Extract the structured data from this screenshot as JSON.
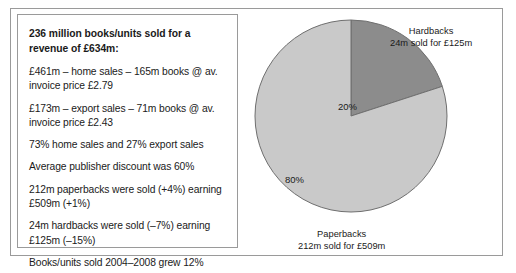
{
  "figure": {
    "panel_headline": "236 million books/units sold for a revenue of £634m:",
    "stat_lines": [
      "£461m – home sales – 165m books @ av. invoice price £2.79",
      "£173m – export sales – 71m books @ av. invoice price £2.43",
      "73% home sales and 27% export sales",
      "Average publisher discount was 60%",
      "212m paperbacks were sold (+4%) earning £509m (+1%)",
      "24m hardbacks were sold (–7%) earning £125m (–15%)",
      "Books/units sold 2004–2008 grew 12%",
      "Invoice value 2004–2008 went up 9%"
    ]
  },
  "chart_data": {
    "type": "pie",
    "title": "",
    "categories": [
      "Hardbacks",
      "Paperbacks"
    ],
    "values": [
      20,
      80
    ],
    "value_unit": "percent",
    "data_labels": [
      "20%",
      "80%"
    ],
    "annotations": [
      {
        "name": "Hardbacks",
        "detail": "24m sold for £125m",
        "position": "top-right"
      },
      {
        "name": "Paperbacks",
        "detail": "212m sold for £509m",
        "position": "bottom"
      }
    ],
    "slice_colors": [
      "#8c8c8c",
      "#c9c9c9"
    ],
    "start_angle_deg": 0,
    "direction": "clockwise",
    "legend": false,
    "grid": false
  }
}
